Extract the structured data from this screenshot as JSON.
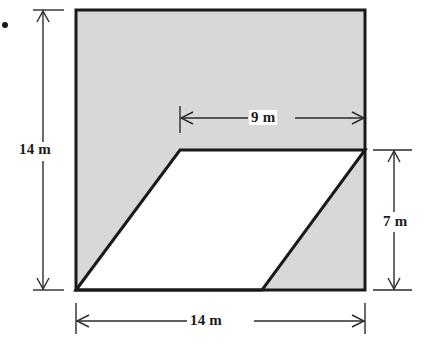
{
  "figure": {
    "kind": "geometry-diagram",
    "colors": {
      "shaded_fill": "#d8d8d8",
      "unshaded_fill": "#ffffff",
      "outline": "#1a1a1a",
      "dimension_line": "#2b2b2b",
      "background": "#ffffff"
    },
    "bullet": {
      "name": "bullet-marker",
      "x": 5,
      "y": 25,
      "radius": 3
    },
    "square": {
      "left": 76,
      "top": 10,
      "right": 365,
      "bottom": 290,
      "width_m": 14,
      "height_m": 14
    },
    "parallelogram": {
      "vertices_px": [
        [
          76,
          290
        ],
        [
          180,
          150
        ],
        [
          365,
          150
        ],
        [
          262,
          290
        ]
      ],
      "top_edge_m": 9,
      "height_m": 7
    },
    "dimensions": [
      {
        "name": "left-height-dimension",
        "label": "14 m",
        "value": 14,
        "unit": "m",
        "orientation": "vertical",
        "position": "left",
        "from_px": [
          43,
          10
        ],
        "to_px": [
          43,
          290
        ]
      },
      {
        "name": "bottom-width-dimension",
        "label": "14 m",
        "value": 14,
        "unit": "m",
        "orientation": "horizontal",
        "position": "bottom",
        "from_px": [
          76,
          321
        ],
        "to_px": [
          365,
          321
        ]
      },
      {
        "name": "top-parallelogram-width-dimension",
        "label": "9 m",
        "value": 9,
        "unit": "m",
        "orientation": "horizontal",
        "position": "top-inner",
        "from_px": [
          180,
          118
        ],
        "to_px": [
          365,
          118
        ]
      },
      {
        "name": "right-height-dimension",
        "label": "7 m",
        "value": 7,
        "unit": "m",
        "orientation": "vertical",
        "position": "right",
        "from_px": [
          394,
          150
        ],
        "to_px": [
          394,
          290
        ]
      }
    ]
  }
}
